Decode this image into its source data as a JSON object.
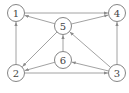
{
  "graph": {
    "type": "directed",
    "nodes": [
      {
        "id": "1",
        "label": "1",
        "x": 16,
        "y": 13
      },
      {
        "id": "4",
        "label": "4",
        "x": 117,
        "y": 13
      },
      {
        "id": "5",
        "label": "5",
        "x": 63,
        "y": 26
      },
      {
        "id": "6",
        "label": "6",
        "x": 63,
        "y": 60
      },
      {
        "id": "2",
        "label": "2",
        "x": 16,
        "y": 73
      },
      {
        "id": "3",
        "label": "3",
        "x": 117,
        "y": 73
      }
    ],
    "edges": [
      {
        "from": "1",
        "to": "4"
      },
      {
        "from": "5",
        "to": "1"
      },
      {
        "from": "5",
        "to": "4"
      },
      {
        "from": "2",
        "to": "1"
      },
      {
        "from": "5",
        "to": "2"
      },
      {
        "from": "6",
        "to": "5"
      },
      {
        "from": "6",
        "to": "2"
      },
      {
        "from": "2",
        "to": "3"
      },
      {
        "from": "3",
        "to": "6"
      },
      {
        "from": "3",
        "to": "5"
      },
      {
        "from": "3",
        "to": "4"
      }
    ],
    "node_radius": 8.5,
    "colors": {
      "stroke": "#777777",
      "edge": "#8a8a8a",
      "text": "#444444"
    }
  }
}
